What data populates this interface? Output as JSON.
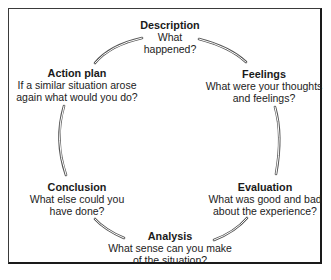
{
  "diagram": {
    "type": "cycle",
    "name": "Reflective cycle",
    "nodes": [
      {
        "id": "description",
        "title": "Description",
        "desc_lines": [
          "What",
          "happened?"
        ]
      },
      {
        "id": "feelings",
        "title": "Feelings",
        "desc_lines": [
          "What were your thoughts",
          "and feelings?"
        ]
      },
      {
        "id": "evaluation",
        "title": "Evaluation",
        "desc_lines": [
          "What was good and bad",
          "about the experience?"
        ]
      },
      {
        "id": "analysis",
        "title": "Analysis",
        "desc_lines": [
          "What sense can you make",
          "of the situation?"
        ]
      },
      {
        "id": "conclusion",
        "title": "Conclusion",
        "desc_lines": [
          "What else could you",
          "have done?"
        ]
      },
      {
        "id": "action_plan",
        "title": "Action plan",
        "desc_lines": [
          "If a similar situation arose",
          "again what would you do?"
        ]
      }
    ],
    "colors": {
      "border": "#1a1a1a",
      "arc": "#555555",
      "text": "#1a1a1a"
    }
  }
}
